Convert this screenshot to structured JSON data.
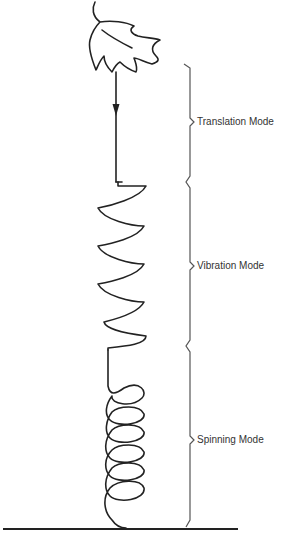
{
  "diagram": {
    "type": "leaf-fall-trajectory",
    "colors": {
      "stroke": "#222222",
      "bracket": "#555555",
      "text": "#333333",
      "background": "#ffffff"
    },
    "modes": [
      {
        "id": "translation",
        "label": "Translation Mode"
      },
      {
        "id": "vibration",
        "label": "Vibration Mode"
      },
      {
        "id": "spinning",
        "label": "Spinning Mode"
      }
    ],
    "icons": {
      "leaf": "leaf-icon",
      "arrow": "arrow-down-icon"
    }
  }
}
